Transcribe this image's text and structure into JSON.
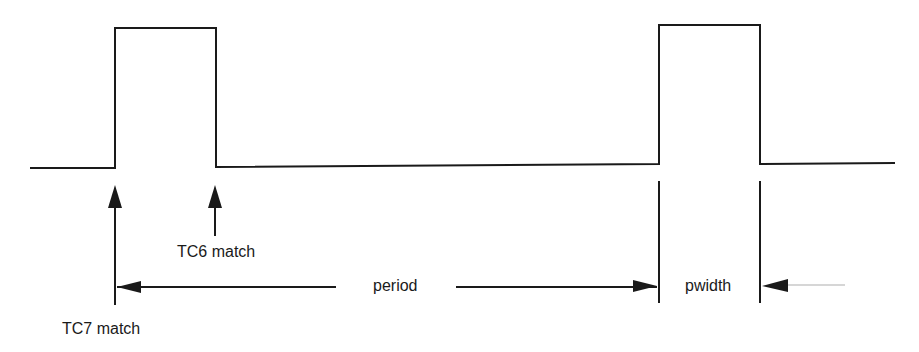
{
  "diagram": {
    "type": "timing-diagram",
    "signal": "PWM output",
    "colors": {
      "line": "#1a1a1a",
      "faint_line": "#c8c8c8",
      "background": "#ffffff"
    },
    "labels": {
      "tc6": "TC6 match",
      "tc7": "TC7 match",
      "period": "period",
      "pwidth": "pwidth"
    },
    "pulses": [
      {
        "name": "pulse-1",
        "rise_x": 115,
        "fall_x": 216
      },
      {
        "name": "pulse-2",
        "rise_x": 659,
        "fall_x": 760
      }
    ]
  }
}
